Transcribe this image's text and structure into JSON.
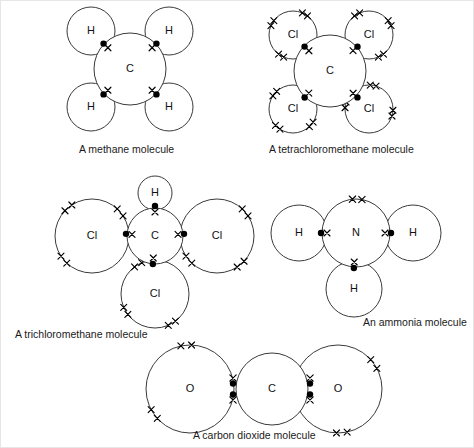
{
  "figure": {
    "background_color": "#ffffff",
    "line_color": "#3a3a3a",
    "dot_color": "#000000",
    "cross_color": "#000000"
  },
  "legend_semantics": {
    "dot_meaning": "electron from central atom",
    "cross_meaning": "electron from outer atom"
  },
  "molecules": [
    {
      "id": "methane",
      "caption": "A methane molecule",
      "formula": "CH4",
      "central_atom": "C",
      "outer_atoms": [
        "H",
        "H",
        "H",
        "H"
      ],
      "bonds": 4,
      "bond_type": "single",
      "lone_pairs_on_central": 0,
      "caption_x": 78,
      "caption_y": 152,
      "center": {
        "x": 129,
        "y": 68,
        "r": 36
      },
      "central_label": "C",
      "outer": [
        {
          "label": "H",
          "x": 90,
          "y": 30,
          "r": 24,
          "bond_x": 104,
          "bond_y": 44,
          "dot_first": true
        },
        {
          "label": "H",
          "x": 168,
          "y": 30,
          "r": 24,
          "bond_x": 154,
          "bond_y": 44,
          "dot_first": true
        },
        {
          "label": "H",
          "x": 90,
          "y": 106,
          "r": 24,
          "bond_x": 104,
          "bond_y": 92,
          "dot_first": true
        },
        {
          "label": "H",
          "x": 168,
          "y": 106,
          "r": 24,
          "bond_x": 154,
          "bond_y": 92,
          "dot_first": true
        }
      ]
    },
    {
      "id": "tetrachloromethane",
      "caption": "A tetrachloromethane  molecule",
      "formula": "CCl4",
      "central_atom": "C",
      "outer_atoms": [
        "Cl",
        "Cl",
        "Cl",
        "Cl"
      ],
      "bonds": 4,
      "bond_type": "single",
      "lone_pairs_on_each_outer": 3,
      "caption_x": 268,
      "caption_y": 152,
      "center": {
        "x": 329,
        "y": 70,
        "r": 36
      },
      "central_label": "C",
      "outer": [
        {
          "label": "Cl",
          "x": 292,
          "y": 34,
          "r": 24,
          "bond_x": 305,
          "bond_y": 47,
          "lone_cross_pairs": 3,
          "lone_start_deg": 120
        },
        {
          "label": "Cl",
          "x": 368,
          "y": 34,
          "r": 24,
          "bond_x": 355,
          "bond_y": 47,
          "lone_cross_pairs": 3,
          "lone_start_deg": 240
        },
        {
          "label": "Cl",
          "x": 292,
          "y": 108,
          "r": 24,
          "bond_x": 305,
          "bond_y": 95,
          "lone_cross_pairs": 3,
          "lone_start_deg": 40
        },
        {
          "label": "Cl",
          "x": 368,
          "y": 108,
          "r": 24,
          "bond_x": 355,
          "bond_y": 95,
          "lone_cross_pairs": 3,
          "lone_start_deg": 190
        }
      ]
    },
    {
      "id": "trichloromethane",
      "caption": "A trichloromethane molecule",
      "formula": "CHCl3",
      "central_atom": "C",
      "outer_atoms": [
        "H",
        "Cl",
        "Cl",
        "Cl"
      ],
      "bonds": 4,
      "bond_type": "single",
      "lone_pairs_on_each_chlorine": 3,
      "caption_x": 14,
      "caption_y": 337,
      "center": {
        "x": 154,
        "y": 235,
        "r": 28
      },
      "central_label": "C",
      "outer": [
        {
          "label": "H",
          "x": 154,
          "y": 192,
          "r": 17,
          "bond_x": 154,
          "bond_y": 207,
          "lone_cross_pairs": 0
        },
        {
          "label": "Cl",
          "x": 91,
          "y": 235,
          "r": 37,
          "bond_x": 127,
          "bond_y": 233,
          "lone_cross_pairs": 3,
          "lone_start_deg": 140
        },
        {
          "label": "Cl",
          "x": 216,
          "y": 235,
          "r": 37,
          "bond_x": 181,
          "bond_y": 233,
          "lone_cross_pairs": 3,
          "lone_start_deg": 320
        },
        {
          "label": "Cl",
          "x": 154,
          "y": 293,
          "r": 34,
          "bond_x": 152,
          "bond_y": 261,
          "lone_cross_pairs": 3,
          "lone_start_deg": 60
        }
      ]
    },
    {
      "id": "ammonia",
      "caption": "An ammonia molecule",
      "formula": "NH3",
      "central_atom": "N",
      "outer_atoms": [
        "H",
        "H",
        "H"
      ],
      "bonds": 3,
      "bond_type": "single",
      "lone_pairs_on_central": 1,
      "caption_x": 362,
      "caption_y": 325,
      "center": {
        "x": 355,
        "y": 232,
        "r": 34
      },
      "central_label": "N",
      "central_lone_pair_deg": 272,
      "outer": [
        {
          "label": "H",
          "x": 298,
          "y": 232,
          "r": 28,
          "bond_x": 322,
          "bond_y": 232
        },
        {
          "label": "H",
          "x": 412,
          "y": 232,
          "r": 28,
          "bond_x": 388,
          "bond_y": 232
        },
        {
          "label": "H",
          "x": 353,
          "y": 288,
          "r": 28,
          "bond_x": 353,
          "bond_y": 265
        }
      ]
    },
    {
      "id": "carbon-dioxide",
      "caption": "A carbon dioxide molecule",
      "formula": "CO2",
      "central_atom": "C",
      "outer_atoms": [
        "O",
        "O"
      ],
      "bonds": 2,
      "bond_type": "double",
      "lone_pairs_on_each_oxygen": 2,
      "caption_x": 192,
      "caption_y": 438,
      "center": {
        "x": 271,
        "y": 388,
        "r": 36
      },
      "central_label": "C",
      "outer": [
        {
          "label": "O",
          "x": 189,
          "y": 388,
          "r": 44,
          "bond_x": 232,
          "bond_y": 388,
          "lone_cross_pairs": 2,
          "lone_start_deg": 145
        },
        {
          "label": "O",
          "x": 337,
          "y": 388,
          "r": 44,
          "bond_x": 309,
          "bond_y": 388,
          "lone_cross_pairs": 2,
          "lone_start_deg": 325
        }
      ]
    }
  ]
}
